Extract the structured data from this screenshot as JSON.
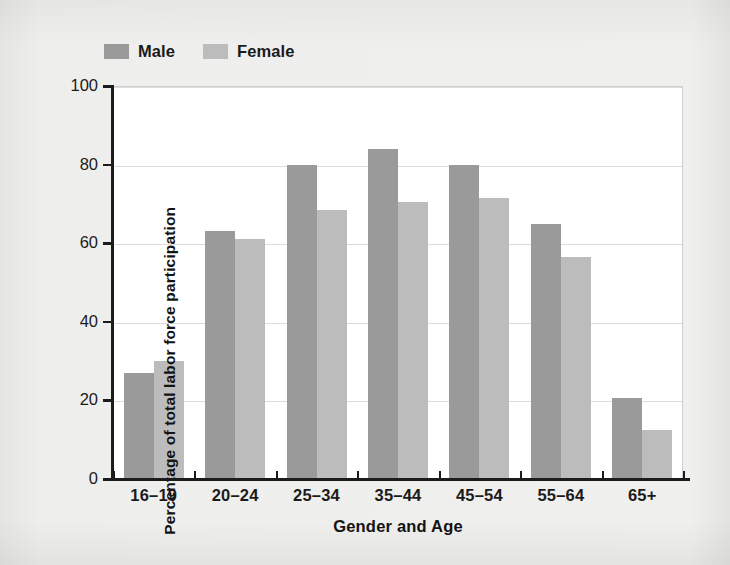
{
  "chart_data": {
    "type": "bar",
    "title": "",
    "xlabel": "Gender and Age",
    "ylabel": "Percentage of total labor force participation",
    "categories": [
      "16–19",
      "20–24",
      "25–34",
      "35–44",
      "45–54",
      "55–64",
      "65+"
    ],
    "series": [
      {
        "name": "Male",
        "color": "#9a9a9a",
        "values": [
          27,
          63,
          80,
          84,
          80,
          65,
          20.5
        ]
      },
      {
        "name": "Female",
        "color": "#bcbcbc",
        "values": [
          30,
          61,
          68.5,
          70.5,
          71.5,
          56.5,
          12.5
        ]
      }
    ],
    "ylim": [
      0,
      100
    ],
    "yticks": [
      0,
      20,
      40,
      60,
      80,
      100
    ],
    "ytick_labels": [
      "0",
      "20",
      "40",
      "60",
      "80",
      "100"
    ],
    "grid": true,
    "legend_position": "top-left",
    "bar_group_order": [
      "Male",
      "Female"
    ]
  },
  "legend": {
    "entries": [
      {
        "label": "Male",
        "swatch_color": "#9a9a9a"
      },
      {
        "label": "Female",
        "swatch_color": "#bcbcbc"
      }
    ]
  },
  "axes": {
    "y_title": "Percentage of total labor force participation",
    "x_title": "Gender and Age"
  }
}
